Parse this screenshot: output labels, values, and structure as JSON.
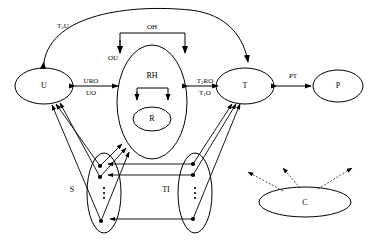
{
  "diagram": {
    "title": "",
    "background_color": "#ffffff",
    "stroke_color": "#000000",
    "nodes": [
      {
        "id": "U",
        "label": "U",
        "shape": "ellipse",
        "cx": 44,
        "cy": 86,
        "rx": 29,
        "ry": 18
      },
      {
        "id": "RH",
        "label": "RH",
        "shape": "ellipse",
        "cx": 152,
        "cy": 102,
        "rx": 35,
        "ry": 57
      },
      {
        "id": "R",
        "label": "R",
        "shape": "ellipse",
        "cx": 152,
        "cy": 119,
        "rx": 19,
        "ry": 12
      },
      {
        "id": "T",
        "label": "T",
        "shape": "ellipse",
        "cx": 245,
        "cy": 86,
        "rx": 29,
        "ry": 18
      },
      {
        "id": "P",
        "label": "P",
        "shape": "ellipse",
        "cx": 338,
        "cy": 86,
        "rx": 25,
        "ry": 16
      },
      {
        "id": "S",
        "label": "S",
        "shape": "ellipse",
        "cx": 104,
        "cy": 193,
        "rx": 17,
        "ry": 40
      },
      {
        "id": "TI",
        "label": "TI",
        "shape": "ellipse",
        "cx": 195,
        "cy": 193,
        "rx": 17,
        "ry": 40
      },
      {
        "id": "C",
        "label": "C",
        "shape": "ellipse",
        "cx": 305,
        "cy": 202,
        "rx": 46,
        "ry": 15
      }
    ],
    "edge_labels": [
      {
        "id": "T2U",
        "text": "T",
        "subscript": "2",
        "tail": "U",
        "x": 63,
        "y": 26
      },
      {
        "id": "OH",
        "text": "OH",
        "subscript": "",
        "tail": "",
        "x": 152,
        "y": 27
      },
      {
        "id": "OU",
        "text": "OU",
        "subscript": "",
        "tail": "",
        "x": 113,
        "y": 58
      },
      {
        "id": "URO",
        "text": "URO",
        "subscript": "",
        "tail": "",
        "x": 91,
        "y": 81
      },
      {
        "id": "UO",
        "text": "UO",
        "subscript": "",
        "tail": "",
        "x": 91,
        "y": 93
      },
      {
        "id": "T2RO",
        "text": "T",
        "subscript": "2",
        "tail": "RO",
        "x": 205,
        "y": 81
      },
      {
        "id": "T1O",
        "text": "T",
        "subscript": "1",
        "tail": "O",
        "x": 205,
        "y": 93
      },
      {
        "id": "PT",
        "text": "PT",
        "subscript": "",
        "tail": "",
        "x": 293,
        "y": 76
      }
    ],
    "ellipsis_marks": [
      {
        "id": "s-vdots",
        "parent": "S",
        "x": 104,
        "y": 193
      },
      {
        "id": "ti-vdots",
        "parent": "TI",
        "x": 195,
        "y": 193
      }
    ],
    "instance_dots": [
      {
        "id": "s-dot-1",
        "parent": "S",
        "cx": 100,
        "cy": 166
      },
      {
        "id": "s-dot-2",
        "parent": "S",
        "cx": 100,
        "cy": 177
      },
      {
        "id": "s-dot-3",
        "parent": "S",
        "cx": 101,
        "cy": 221
      },
      {
        "id": "ti-dot-1",
        "parent": "TI",
        "cx": 193,
        "cy": 164
      },
      {
        "id": "ti-dot-2",
        "parent": "TI",
        "cx": 193,
        "cy": 175
      },
      {
        "id": "ti-dot-3",
        "parent": "TI",
        "cx": 193,
        "cy": 219
      }
    ],
    "legend_note": ""
  }
}
